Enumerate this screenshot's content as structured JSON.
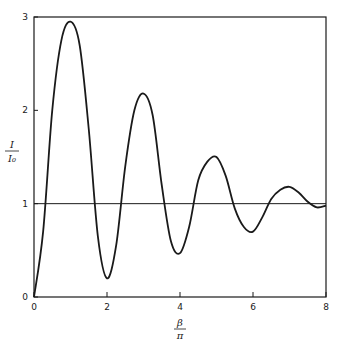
{
  "chart_data": {
    "type": "line",
    "title": "",
    "xlabel": "β/π",
    "ylabel": "I/I₀",
    "xlabel_num": "β",
    "xlabel_den": "π",
    "ylabel_num": "I",
    "ylabel_den": "I₀",
    "xlim": [
      0,
      8
    ],
    "ylim": [
      0,
      3
    ],
    "grid": false,
    "legend": null,
    "x_ticks": [
      "0",
      "2",
      "4",
      "6",
      "8"
    ],
    "y_ticks": [
      "0",
      "1",
      "2",
      "3"
    ],
    "reference_line": {
      "y": 1
    },
    "series": [
      {
        "name": "I/I0",
        "x": [
          0,
          0.25,
          0.5,
          0.75,
          1.0,
          1.25,
          1.5,
          1.75,
          2.0,
          2.25,
          2.5,
          2.75,
          3.0,
          3.25,
          3.5,
          3.75,
          4.0,
          4.25,
          4.5,
          4.75,
          5.0,
          5.25,
          5.5,
          5.75,
          6.0,
          6.25,
          6.5,
          6.75,
          7.0,
          7.25,
          7.5,
          7.75,
          8.0
        ],
        "values": [
          0,
          0.7,
          2.0,
          2.75,
          2.95,
          2.7,
          1.8,
          0.65,
          0.2,
          0.55,
          1.4,
          2.0,
          2.18,
          1.95,
          1.2,
          0.6,
          0.47,
          0.75,
          1.25,
          1.45,
          1.5,
          1.3,
          0.95,
          0.75,
          0.7,
          0.85,
          1.05,
          1.15,
          1.18,
          1.12,
          1.02,
          0.96,
          0.98
        ]
      }
    ]
  }
}
